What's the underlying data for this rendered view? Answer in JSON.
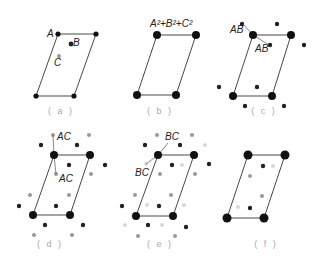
{
  "colors": {
    "lattice": "#111111",
    "dark_dot": "#222222",
    "mid_dot": "#999999",
    "light_dot": "#d8d8d8",
    "caption": "#aaaaaa",
    "line": "#333333"
  },
  "panels": [
    {
      "id": "a",
      "caption": "( a )",
      "caption_pos": [
        61,
        114
      ],
      "cell": [
        [
          58,
          34
        ],
        [
          96,
          34
        ],
        [
          74,
          96
        ],
        [
          36,
          96
        ]
      ],
      "corner_r": 2.6,
      "labels": [
        {
          "text": "A",
          "x": 47,
          "y": 37
        },
        {
          "text": "B",
          "x": 73,
          "y": 46
        },
        {
          "text": "C",
          "x": 54,
          "y": 66
        }
      ],
      "leaders": [],
      "dots": [
        {
          "x": 71,
          "y": 44,
          "r": 2.4,
          "tone": "dark"
        },
        {
          "x": 59,
          "y": 56,
          "r": 2.0,
          "tone": "mid"
        }
      ]
    },
    {
      "id": "b",
      "caption": "( b )",
      "caption_pos": [
        160,
        114
      ],
      "cell": [
        [
          157,
          35
        ],
        [
          196,
          35
        ],
        [
          176,
          95
        ],
        [
          137,
          95
        ]
      ],
      "corner_r": 4.0,
      "labels": [
        {
          "text": "A²+B²+C²",
          "x": 150,
          "y": 27
        }
      ],
      "leaders": [],
      "dots": []
    },
    {
      "id": "c",
      "caption": "( c )",
      "caption_pos": [
        264,
        114
      ],
      "cell": [
        [
          253,
          35
        ],
        [
          291,
          35
        ],
        [
          272,
          96
        ],
        [
          233,
          96
        ]
      ],
      "corner_r": 4.0,
      "labels": [
        {
          "text": "AB",
          "x": 230,
          "y": 33
        },
        {
          "text": "AB",
          "x": 255,
          "y": 52
        }
      ],
      "leaders": [
        [
          [
            243,
            24
          ],
          [
            253,
            35
          ]
        ],
        [
          [
            253,
            35
          ],
          [
            269,
            45
          ]
        ]
      ],
      "dots": [
        {
          "x": 242,
          "y": 24,
          "r": 2.2,
          "tone": "dark"
        },
        {
          "x": 277,
          "y": 24,
          "r": 2.2,
          "tone": "dark"
        },
        {
          "x": 270,
          "y": 45,
          "r": 2.2,
          "tone": "dark"
        },
        {
          "x": 304,
          "y": 45,
          "r": 2.2,
          "tone": "dark"
        },
        {
          "x": 219,
          "y": 87,
          "r": 2.2,
          "tone": "dark"
        },
        {
          "x": 257,
          "y": 87,
          "r": 2.2,
          "tone": "dark"
        },
        {
          "x": 245,
          "y": 106,
          "r": 2.2,
          "tone": "dark"
        },
        {
          "x": 284,
          "y": 106,
          "r": 2.2,
          "tone": "dark"
        }
      ]
    },
    {
      "id": "d",
      "caption": "( d )",
      "caption_pos": [
        50,
        247
      ],
      "cell": [
        [
          54,
          155
        ],
        [
          90,
          155
        ],
        [
          70,
          215
        ],
        [
          33,
          215
        ]
      ],
      "corner_r": 4.0,
      "labels": [
        {
          "text": "AC",
          "x": 57,
          "y": 140
        },
        {
          "text": "AC",
          "x": 59,
          "y": 182
        }
      ],
      "leaders": [
        [
          [
            53,
            135
          ],
          [
            54,
            155
          ]
        ],
        [
          [
            54,
            155
          ],
          [
            56,
            174
          ]
        ]
      ],
      "dots": [
        {
          "x": 53,
          "y": 135,
          "r": 2.0,
          "tone": "mid"
        },
        {
          "x": 89,
          "y": 135,
          "r": 2.0,
          "tone": "mid"
        },
        {
          "x": 41,
          "y": 145,
          "r": 2.2,
          "tone": "dark"
        },
        {
          "x": 77,
          "y": 145,
          "r": 2.2,
          "tone": "dark"
        },
        {
          "x": 69,
          "y": 165,
          "r": 2.2,
          "tone": "dark"
        },
        {
          "x": 105,
          "y": 165,
          "r": 2.2,
          "tone": "dark"
        },
        {
          "x": 56,
          "y": 174,
          "r": 2.0,
          "tone": "mid"
        },
        {
          "x": 91,
          "y": 174,
          "r": 2.0,
          "tone": "mid"
        },
        {
          "x": 30,
          "y": 195,
          "r": 2.0,
          "tone": "mid"
        },
        {
          "x": 69,
          "y": 195,
          "r": 2.0,
          "tone": "mid"
        },
        {
          "x": 19,
          "y": 206,
          "r": 2.2,
          "tone": "dark"
        },
        {
          "x": 56,
          "y": 206,
          "r": 2.2,
          "tone": "dark"
        },
        {
          "x": 45,
          "y": 225,
          "r": 2.2,
          "tone": "dark"
        },
        {
          "x": 83,
          "y": 225,
          "r": 2.2,
          "tone": "dark"
        },
        {
          "x": 34,
          "y": 235,
          "r": 2.0,
          "tone": "mid"
        },
        {
          "x": 72,
          "y": 235,
          "r": 2.0,
          "tone": "mid"
        }
      ]
    },
    {
      "id": "e",
      "caption": "( e )",
      "caption_pos": [
        160,
        247
      ],
      "cell": [
        [
          158,
          155
        ],
        [
          194,
          155
        ],
        [
          173,
          216
        ],
        [
          136,
          216
        ]
      ],
      "corner_r": 4.0,
      "labels": [
        {
          "text": "BC",
          "x": 165,
          "y": 140
        },
        {
          "text": "BC",
          "x": 135,
          "y": 176
        }
      ],
      "leaders": [
        [
          [
            168,
            143
          ],
          [
            158,
            155
          ]
        ],
        [
          [
            158,
            155
          ],
          [
            146,
            164
          ]
        ]
      ],
      "dots": [
        {
          "x": 157,
          "y": 135,
          "r": 2.0,
          "tone": "mid"
        },
        {
          "x": 192,
          "y": 135,
          "r": 2.0,
          "tone": "mid"
        },
        {
          "x": 145,
          "y": 145,
          "r": 2.2,
          "tone": "dark"
        },
        {
          "x": 180,
          "y": 145,
          "r": 2.2,
          "tone": "dark"
        },
        {
          "x": 205,
          "y": 145,
          "r": 2.0,
          "tone": "light"
        },
        {
          "x": 146,
          "y": 164,
          "r": 2.0,
          "tone": "light"
        },
        {
          "x": 172,
          "y": 165,
          "r": 2.2,
          "tone": "dark"
        },
        {
          "x": 182,
          "y": 165,
          "r": 2.0,
          "tone": "light"
        },
        {
          "x": 209,
          "y": 164,
          "r": 2.2,
          "tone": "dark"
        },
        {
          "x": 160,
          "y": 174,
          "r": 2.0,
          "tone": "mid"
        },
        {
          "x": 195,
          "y": 174,
          "r": 2.0,
          "tone": "mid"
        },
        {
          "x": 135,
          "y": 195,
          "r": 2.0,
          "tone": "mid"
        },
        {
          "x": 171,
          "y": 195,
          "r": 2.0,
          "tone": "mid"
        },
        {
          "x": 122,
          "y": 206,
          "r": 2.2,
          "tone": "dark"
        },
        {
          "x": 147,
          "y": 205,
          "r": 2.0,
          "tone": "light"
        },
        {
          "x": 159,
          "y": 206,
          "r": 2.2,
          "tone": "dark"
        },
        {
          "x": 184,
          "y": 205,
          "r": 2.0,
          "tone": "light"
        },
        {
          "x": 125,
          "y": 225,
          "r": 2.0,
          "tone": "light"
        },
        {
          "x": 148,
          "y": 225,
          "r": 2.2,
          "tone": "dark"
        },
        {
          "x": 162,
          "y": 225,
          "r": 2.0,
          "tone": "light"
        },
        {
          "x": 186,
          "y": 227,
          "r": 2.2,
          "tone": "dark"
        },
        {
          "x": 138,
          "y": 236,
          "r": 2.0,
          "tone": "mid"
        },
        {
          "x": 175,
          "y": 236,
          "r": 2.0,
          "tone": "mid"
        }
      ]
    },
    {
      "id": "f",
      "caption": "( f )",
      "caption_pos": [
        266,
        247
      ],
      "cell": [
        [
          248,
          155
        ],
        [
          285,
          155
        ],
        [
          264,
          218
        ],
        [
          227,
          218
        ]
      ],
      "corner_r": 4.5,
      "labels": [],
      "leaders": [],
      "dots": [
        {
          "x": 263,
          "y": 166,
          "r": 2.2,
          "tone": "dark"
        },
        {
          "x": 273,
          "y": 166,
          "r": 2.0,
          "tone": "light"
        },
        {
          "x": 250,
          "y": 176,
          "r": 2.0,
          "tone": "mid"
        },
        {
          "x": 262,
          "y": 196,
          "r": 2.0,
          "tone": "mid"
        },
        {
          "x": 238,
          "y": 207,
          "r": 2.0,
          "tone": "light"
        },
        {
          "x": 250,
          "y": 208,
          "r": 2.2,
          "tone": "dark"
        }
      ]
    }
  ]
}
